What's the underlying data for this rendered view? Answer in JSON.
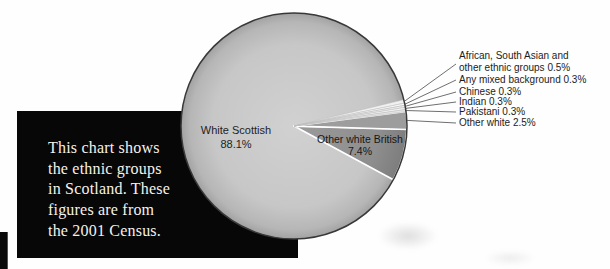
{
  "intro_box": {
    "text": "This chart shows\nthe ethnic groups\nin Scotland. These\nfigures are from\nthe 2001 Census."
  },
  "chart_data": {
    "type": "pie",
    "center": [
      294,
      126
    ],
    "radius": 113,
    "start_angle_deg": 118.4,
    "outline_color": "#383838",
    "leader_line_color": "#4a4a4a",
    "slices": [
      {
        "name": "White Scottish",
        "value": 88.1,
        "fill": "#c6c6c6",
        "gradient": [
          [
            0,
            "#d1d1d1"
          ],
          [
            0.72,
            "#c7c7c7"
          ],
          [
            0.92,
            "#b6b6b6"
          ],
          [
            1,
            "#a2a2a2"
          ]
        ],
        "stroke": "none",
        "sw": 0,
        "z": 0
      },
      {
        "name": "African, South Asian and other ethnic groups",
        "value": 0.5,
        "fill": "#f1f1f1",
        "stroke": "#b9b9b9",
        "sw": 0.6,
        "z": 3
      },
      {
        "name": "Any mixed background",
        "value": 0.3,
        "fill": "#fafafa",
        "stroke": "#bdbdbd",
        "sw": 0.6,
        "z": 3
      },
      {
        "name": "Chinese",
        "value": 0.3,
        "fill": "#ededed",
        "stroke": "#b9b9b9",
        "sw": 0.6,
        "z": 3
      },
      {
        "name": "Indian",
        "value": 0.3,
        "fill": "#f7f7f7",
        "stroke": "#bdbdbd",
        "sw": 0.6,
        "z": 3
      },
      {
        "name": "Pakistani",
        "value": 0.3,
        "fill": "#e8e8e8",
        "stroke": "#bdbdbd",
        "sw": 0.6,
        "z": 3
      },
      {
        "name": "Other white",
        "value": 2.5,
        "fill": "#9d9d9d",
        "stroke": "#ffffff",
        "sw": 1.3,
        "z": 2
      },
      {
        "name": "Other white British",
        "value": 7.4,
        "fill": "#8f8f8f",
        "gradient": [
          [
            0,
            "#9a9a9a"
          ],
          [
            0.75,
            "#8e8e8e"
          ],
          [
            1,
            "#7d7d7d"
          ]
        ],
        "stroke": "#ffffff",
        "sw": 1.8,
        "z": 1
      }
    ],
    "internal_labels": [
      {
        "text": "White Scottish\n88.1%",
        "x": 236,
        "y": 124
      },
      {
        "text": "Other white British\n7.4%",
        "x": 360,
        "y": 134
      }
    ],
    "callouts": [
      {
        "label": "African, South Asian and\nother ethnic groups 0.5%",
        "slice": 1,
        "x": 459,
        "y": 50,
        "line_x": 456,
        "line_y": 64
      },
      {
        "label": "Any mixed background 0.3%",
        "slice": 2,
        "x": 459,
        "y": 74,
        "line_x": 456,
        "line_y": 80
      },
      {
        "label": "Chinese 0.3%",
        "slice": 3,
        "x": 459,
        "y": 86,
        "line_x": 456,
        "line_y": 92
      },
      {
        "label": "Indian 0.3%",
        "slice": 4,
        "x": 459,
        "y": 96,
        "line_x": 456,
        "line_y": 102
      },
      {
        "label": "Pakistani 0.3%",
        "slice": 5,
        "x": 459,
        "y": 106,
        "line_x": 456,
        "line_y": 112
      },
      {
        "label": "Other white 2.5%",
        "slice": 6,
        "x": 459,
        "y": 117,
        "line_x": 456,
        "line_y": 123
      }
    ]
  }
}
